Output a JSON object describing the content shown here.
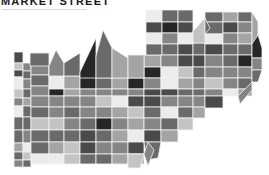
{
  "header": {
    "title": "MARKET STREET"
  },
  "map": {
    "style": "grayscale tiled choropleth",
    "palette": {
      "lightest": "#ececec",
      "light": "#c4c4c4",
      "mid_light": "#a4a4a4",
      "mid": "#858585",
      "mid_dark": "#6a6a6a",
      "dark": "#4a4a4a",
      "darkest": "#262626",
      "stroke": "#f2f2f2"
    },
    "tiles": [
      {
        "x": 14,
        "y": 52,
        "w": 9,
        "h": 11,
        "f": "#4a4a4a"
      },
      {
        "x": 14,
        "y": 63,
        "w": 9,
        "h": 7,
        "f": "#c4c4c4"
      },
      {
        "x": 14,
        "y": 70,
        "w": 9,
        "h": 7,
        "f": "#4a4a4a"
      },
      {
        "x": 14,
        "y": 77,
        "w": 9,
        "h": 12,
        "f": "#ececec"
      },
      {
        "x": 14,
        "y": 89,
        "w": 9,
        "h": 9,
        "f": "#c4c4c4"
      },
      {
        "x": 14,
        "y": 98,
        "w": 9,
        "h": 8,
        "f": "#858585"
      },
      {
        "x": 14,
        "y": 106,
        "w": 9,
        "h": 11,
        "f": "#ececec"
      },
      {
        "x": 14,
        "y": 117,
        "w": 9,
        "h": 13,
        "f": "#6a6a6a"
      },
      {
        "x": 14,
        "y": 130,
        "w": 9,
        "h": 13,
        "f": "#6a6a6a"
      },
      {
        "x": 14,
        "y": 143,
        "w": 9,
        "h": 9,
        "f": "#a4a4a4"
      },
      {
        "x": 14,
        "y": 152,
        "w": 9,
        "h": 8,
        "f": "#6a6a6a"
      },
      {
        "x": 14,
        "y": 160,
        "w": 9,
        "h": 7,
        "f": "#858585"
      },
      {
        "x": 23,
        "y": 63,
        "w": 8,
        "h": 8,
        "f": "#858585"
      },
      {
        "x": 23,
        "y": 71,
        "w": 8,
        "h": 8,
        "f": "#6a6a6a"
      },
      {
        "x": 23,
        "y": 79,
        "w": 8,
        "h": 10,
        "f": "#858585"
      },
      {
        "x": 23,
        "y": 89,
        "w": 8,
        "h": 9,
        "f": "#6a6a6a"
      },
      {
        "x": 23,
        "y": 98,
        "w": 8,
        "h": 8,
        "f": "#a4a4a4"
      },
      {
        "x": 23,
        "y": 106,
        "w": 8,
        "h": 11,
        "f": "#6a6a6a"
      },
      {
        "x": 23,
        "y": 117,
        "w": 8,
        "h": 13,
        "f": "#6a6a6a"
      },
      {
        "x": 23,
        "y": 130,
        "w": 8,
        "h": 13,
        "f": "#858585"
      },
      {
        "x": 23,
        "y": 143,
        "w": 8,
        "h": 9,
        "f": "#ececec"
      },
      {
        "x": 23,
        "y": 152,
        "w": 8,
        "h": 8,
        "f": "#c4c4c4"
      },
      {
        "x": 23,
        "y": 160,
        "w": 8,
        "h": 7,
        "f": "#6a6a6a"
      },
      {
        "x": 31,
        "y": 53,
        "w": 18,
        "h": 11,
        "f": "#6a6a6a"
      },
      {
        "x": 31,
        "y": 64,
        "w": 18,
        "h": 11,
        "f": "#858585"
      },
      {
        "x": 31,
        "y": 75,
        "w": 18,
        "h": 11,
        "f": "#6a6a6a"
      },
      {
        "x": 31,
        "y": 86,
        "w": 18,
        "h": 10,
        "f": "#858585"
      },
      {
        "x": 31,
        "y": 96,
        "w": 18,
        "h": 11,
        "f": "#858585"
      },
      {
        "x": 31,
        "y": 107,
        "w": 18,
        "h": 11,
        "f": "#6a6a6a"
      },
      {
        "x": 31,
        "y": 118,
        "w": 18,
        "h": 12,
        "f": "#c4c4c4"
      },
      {
        "x": 31,
        "y": 130,
        "w": 18,
        "h": 12,
        "f": "#6a6a6a"
      },
      {
        "x": 31,
        "y": 142,
        "w": 18,
        "h": 12,
        "f": "#6a6a6a"
      },
      {
        "x": 31,
        "y": 154,
        "w": 18,
        "h": 10,
        "f": "#ececec"
      },
      {
        "x": 49,
        "y": 66,
        "w": 15,
        "h": 10,
        "f": "#858585"
      },
      {
        "x": 49,
        "y": 76,
        "w": 15,
        "h": 13,
        "f": "#ececec"
      },
      {
        "x": 49,
        "y": 89,
        "w": 15,
        "h": 7,
        "f": "#262626"
      },
      {
        "x": 49,
        "y": 96,
        "w": 15,
        "h": 11,
        "f": "#858585"
      },
      {
        "x": 49,
        "y": 107,
        "w": 15,
        "h": 11,
        "f": "#858585"
      },
      {
        "x": 49,
        "y": 118,
        "w": 15,
        "h": 12,
        "f": "#c4c4c4"
      },
      {
        "x": 49,
        "y": 130,
        "w": 15,
        "h": 12,
        "f": "#6a6a6a"
      },
      {
        "x": 49,
        "y": 142,
        "w": 15,
        "h": 12,
        "f": "#a4a4a4"
      },
      {
        "x": 49,
        "y": 154,
        "w": 15,
        "h": 10,
        "f": "#ececec"
      },
      {
        "x": 64,
        "y": 63,
        "w": 16,
        "h": 13,
        "f": "#6a6a6a"
      },
      {
        "x": 64,
        "y": 76,
        "w": 16,
        "h": 13,
        "f": "#a4a4a4"
      },
      {
        "x": 64,
        "y": 89,
        "w": 16,
        "h": 7,
        "f": "#a4a4a4"
      },
      {
        "x": 64,
        "y": 96,
        "w": 16,
        "h": 11,
        "f": "#858585"
      },
      {
        "x": 64,
        "y": 107,
        "w": 16,
        "h": 11,
        "f": "#6a6a6a"
      },
      {
        "x": 64,
        "y": 118,
        "w": 16,
        "h": 12,
        "f": "#858585"
      },
      {
        "x": 64,
        "y": 130,
        "w": 16,
        "h": 12,
        "f": "#6a6a6a"
      },
      {
        "x": 64,
        "y": 142,
        "w": 16,
        "h": 12,
        "f": "#c4c4c4"
      },
      {
        "x": 64,
        "y": 154,
        "w": 16,
        "h": 10,
        "f": "#c4c4c4"
      },
      {
        "x": 80,
        "y": 72,
        "w": 16,
        "h": 17,
        "f": "#262626"
      },
      {
        "x": 80,
        "y": 89,
        "w": 16,
        "h": 7,
        "f": "#858585"
      },
      {
        "x": 80,
        "y": 96,
        "w": 16,
        "h": 11,
        "f": "#858585"
      },
      {
        "x": 80,
        "y": 107,
        "w": 16,
        "h": 11,
        "f": "#858585"
      },
      {
        "x": 80,
        "y": 118,
        "w": 16,
        "h": 12,
        "f": "#6a6a6a"
      },
      {
        "x": 80,
        "y": 130,
        "w": 16,
        "h": 12,
        "f": "#4a4a4a"
      },
      {
        "x": 80,
        "y": 142,
        "w": 16,
        "h": 12,
        "f": "#4a4a4a"
      },
      {
        "x": 80,
        "y": 154,
        "w": 16,
        "h": 10,
        "f": "#6a6a6a"
      },
      {
        "x": 96,
        "y": 56,
        "w": 16,
        "h": 22,
        "f": "#6a6a6a"
      },
      {
        "x": 96,
        "y": 78,
        "w": 16,
        "h": 11,
        "f": "#6a6a6a"
      },
      {
        "x": 96,
        "y": 89,
        "w": 16,
        "h": 7,
        "f": "#858585"
      },
      {
        "x": 96,
        "y": 96,
        "w": 16,
        "h": 11,
        "f": "#c4c4c4"
      },
      {
        "x": 96,
        "y": 107,
        "w": 16,
        "h": 11,
        "f": "#858585"
      },
      {
        "x": 96,
        "y": 118,
        "w": 16,
        "h": 12,
        "f": "#262626"
      },
      {
        "x": 96,
        "y": 130,
        "w": 16,
        "h": 12,
        "f": "#6a6a6a"
      },
      {
        "x": 96,
        "y": 142,
        "w": 16,
        "h": 12,
        "f": "#858585"
      },
      {
        "x": 96,
        "y": 154,
        "w": 16,
        "h": 10,
        "f": "#6a6a6a"
      },
      {
        "x": 112,
        "y": 58,
        "w": 16,
        "h": 20,
        "f": "#a4a4a4"
      },
      {
        "x": 112,
        "y": 78,
        "w": 16,
        "h": 11,
        "f": "#a4a4a4"
      },
      {
        "x": 112,
        "y": 89,
        "w": 16,
        "h": 7,
        "f": "#858585"
      },
      {
        "x": 112,
        "y": 96,
        "w": 16,
        "h": 11,
        "f": "#ececec"
      },
      {
        "x": 112,
        "y": 107,
        "w": 16,
        "h": 11,
        "f": "#a4a4a4"
      },
      {
        "x": 112,
        "y": 118,
        "w": 16,
        "h": 12,
        "f": "#858585"
      },
      {
        "x": 112,
        "y": 130,
        "w": 16,
        "h": 12,
        "f": "#a4a4a4"
      },
      {
        "x": 112,
        "y": 142,
        "w": 16,
        "h": 12,
        "f": "#858585"
      },
      {
        "x": 112,
        "y": 154,
        "w": 16,
        "h": 10,
        "f": "#a4a4a4"
      },
      {
        "x": 128,
        "y": 55,
        "w": 16,
        "h": 23,
        "f": "#a4a4a4"
      },
      {
        "x": 128,
        "y": 78,
        "w": 16,
        "h": 11,
        "f": "#262626"
      },
      {
        "x": 128,
        "y": 89,
        "w": 16,
        "h": 7,
        "f": "#858585"
      },
      {
        "x": 128,
        "y": 96,
        "w": 16,
        "h": 11,
        "f": "#4a4a4a"
      },
      {
        "x": 128,
        "y": 107,
        "w": 16,
        "h": 11,
        "f": "#c4c4c4"
      },
      {
        "x": 128,
        "y": 118,
        "w": 16,
        "h": 12,
        "f": "#a4a4a4"
      },
      {
        "x": 128,
        "y": 130,
        "w": 16,
        "h": 12,
        "f": "#ececec"
      },
      {
        "x": 128,
        "y": 142,
        "w": 16,
        "h": 12,
        "f": "#4a4a4a"
      },
      {
        "x": 128,
        "y": 154,
        "w": 16,
        "h": 10,
        "f": "#a4a4a4"
      },
      {
        "x": 144,
        "y": 55,
        "w": 17,
        "h": 12,
        "f": "#a4a4a4"
      },
      {
        "x": 144,
        "y": 67,
        "w": 17,
        "h": 11,
        "f": "#262626"
      },
      {
        "x": 144,
        "y": 78,
        "w": 17,
        "h": 11,
        "f": "#858585"
      },
      {
        "x": 144,
        "y": 89,
        "w": 17,
        "h": 7,
        "f": "#4a4a4a"
      },
      {
        "x": 144,
        "y": 96,
        "w": 17,
        "h": 11,
        "f": "#4a4a4a"
      },
      {
        "x": 144,
        "y": 107,
        "w": 17,
        "h": 11,
        "f": "#6a6a6a"
      },
      {
        "x": 144,
        "y": 118,
        "w": 17,
        "h": 12,
        "f": "#858585"
      },
      {
        "x": 144,
        "y": 130,
        "w": 17,
        "h": 12,
        "f": "#4a4a4a"
      },
      {
        "x": 146,
        "y": 10,
        "w": 16,
        "h": 12,
        "f": "#ececec"
      },
      {
        "x": 146,
        "y": 22,
        "w": 16,
        "h": 11,
        "f": "#4a4a4a"
      },
      {
        "x": 146,
        "y": 33,
        "w": 16,
        "h": 11,
        "f": "#ececec"
      },
      {
        "x": 146,
        "y": 44,
        "w": 16,
        "h": 11,
        "f": "#6a6a6a"
      },
      {
        "x": 162,
        "y": 10,
        "w": 16,
        "h": 12,
        "f": "#6a6a6a"
      },
      {
        "x": 162,
        "y": 22,
        "w": 16,
        "h": 11,
        "f": "#262626"
      },
      {
        "x": 162,
        "y": 33,
        "w": 16,
        "h": 11,
        "f": "#858585"
      },
      {
        "x": 162,
        "y": 44,
        "w": 16,
        "h": 11,
        "f": "#6a6a6a"
      },
      {
        "x": 161,
        "y": 55,
        "w": 17,
        "h": 12,
        "f": "#858585"
      },
      {
        "x": 161,
        "y": 67,
        "w": 17,
        "h": 11,
        "f": "#ececec"
      },
      {
        "x": 161,
        "y": 78,
        "w": 17,
        "h": 11,
        "f": "#ececec"
      },
      {
        "x": 161,
        "y": 89,
        "w": 17,
        "h": 7,
        "f": "#4a4a4a"
      },
      {
        "x": 161,
        "y": 96,
        "w": 17,
        "h": 11,
        "f": "#858585"
      },
      {
        "x": 161,
        "y": 107,
        "w": 17,
        "h": 11,
        "f": "#ececec"
      },
      {
        "x": 161,
        "y": 118,
        "w": 17,
        "h": 12,
        "f": "#6a6a6a"
      },
      {
        "x": 161,
        "y": 130,
        "w": 17,
        "h": 12,
        "f": "#a4a4a4"
      },
      {
        "x": 178,
        "y": 10,
        "w": 15,
        "h": 12,
        "f": "#6a6a6a"
      },
      {
        "x": 178,
        "y": 22,
        "w": 15,
        "h": 11,
        "f": "#4a4a4a"
      },
      {
        "x": 178,
        "y": 33,
        "w": 15,
        "h": 11,
        "f": "#ececec"
      },
      {
        "x": 178,
        "y": 44,
        "w": 15,
        "h": 11,
        "f": "#4a4a4a"
      },
      {
        "x": 178,
        "y": 55,
        "w": 15,
        "h": 12,
        "f": "#4a4a4a"
      },
      {
        "x": 178,
        "y": 67,
        "w": 15,
        "h": 11,
        "f": "#c4c4c4"
      },
      {
        "x": 178,
        "y": 78,
        "w": 15,
        "h": 11,
        "f": "#a4a4a4"
      },
      {
        "x": 178,
        "y": 89,
        "w": 15,
        "h": 7,
        "f": "#6a6a6a"
      },
      {
        "x": 178,
        "y": 96,
        "w": 15,
        "h": 11,
        "f": "#858585"
      },
      {
        "x": 178,
        "y": 107,
        "w": 15,
        "h": 11,
        "f": "#6a6a6a"
      },
      {
        "x": 178,
        "y": 118,
        "w": 15,
        "h": 12,
        "f": "#c4c4c4"
      },
      {
        "x": 193,
        "y": 31,
        "w": 12,
        "h": 12,
        "f": "#858585"
      },
      {
        "x": 193,
        "y": 43,
        "w": 12,
        "h": 12,
        "f": "#6a6a6a"
      },
      {
        "x": 193,
        "y": 55,
        "w": 12,
        "h": 12,
        "f": "#4a4a4a"
      },
      {
        "x": 193,
        "y": 67,
        "w": 12,
        "h": 11,
        "f": "#6a6a6a"
      },
      {
        "x": 193,
        "y": 78,
        "w": 12,
        "h": 11,
        "f": "#858585"
      },
      {
        "x": 193,
        "y": 89,
        "w": 12,
        "h": 7,
        "f": "#6a6a6a"
      },
      {
        "x": 193,
        "y": 96,
        "w": 12,
        "h": 11,
        "f": "#858585"
      },
      {
        "x": 193,
        "y": 107,
        "w": 12,
        "h": 11,
        "f": "#a4a4a4"
      },
      {
        "x": 205,
        "y": 12,
        "w": 18,
        "h": 10,
        "f": "#6a6a6a"
      },
      {
        "x": 205,
        "y": 22,
        "w": 18,
        "h": 12,
        "f": "#6a6a6a"
      },
      {
        "x": 205,
        "y": 34,
        "w": 18,
        "h": 10,
        "f": "#ececec"
      },
      {
        "x": 205,
        "y": 44,
        "w": 18,
        "h": 11,
        "f": "#4a4a4a"
      },
      {
        "x": 205,
        "y": 55,
        "w": 18,
        "h": 12,
        "f": "#858585"
      },
      {
        "x": 205,
        "y": 67,
        "w": 18,
        "h": 11,
        "f": "#858585"
      },
      {
        "x": 205,
        "y": 78,
        "w": 18,
        "h": 11,
        "f": "#c4c4c4"
      },
      {
        "x": 205,
        "y": 89,
        "w": 18,
        "h": 7,
        "f": "#858585"
      },
      {
        "x": 205,
        "y": 96,
        "w": 18,
        "h": 12,
        "f": "#4a4a4a"
      },
      {
        "x": 223,
        "y": 12,
        "w": 15,
        "h": 10,
        "f": "#a4a4a4"
      },
      {
        "x": 223,
        "y": 22,
        "w": 15,
        "h": 11,
        "f": "#4a4a4a"
      },
      {
        "x": 223,
        "y": 33,
        "w": 15,
        "h": 11,
        "f": "#858585"
      },
      {
        "x": 223,
        "y": 44,
        "w": 15,
        "h": 11,
        "f": "#6a6a6a"
      },
      {
        "x": 223,
        "y": 55,
        "w": 15,
        "h": 12,
        "f": "#6a6a6a"
      },
      {
        "x": 223,
        "y": 67,
        "w": 15,
        "h": 11,
        "f": "#858585"
      },
      {
        "x": 223,
        "y": 78,
        "w": 15,
        "h": 11,
        "f": "#858585"
      },
      {
        "x": 223,
        "y": 89,
        "w": 15,
        "h": 7,
        "f": "#ececec"
      },
      {
        "x": 238,
        "y": 12,
        "w": 14,
        "h": 10,
        "f": "#6a6a6a"
      },
      {
        "x": 238,
        "y": 22,
        "w": 14,
        "h": 11,
        "f": "#858585"
      },
      {
        "x": 238,
        "y": 33,
        "w": 14,
        "h": 11,
        "f": "#a4a4a4"
      },
      {
        "x": 238,
        "y": 44,
        "w": 14,
        "h": 11,
        "f": "#6a6a6a"
      },
      {
        "x": 238,
        "y": 55,
        "w": 14,
        "h": 12,
        "f": "#262626"
      },
      {
        "x": 238,
        "y": 67,
        "w": 14,
        "h": 11,
        "f": "#858585"
      },
      {
        "x": 238,
        "y": 78,
        "w": 14,
        "h": 11,
        "f": "#6a6a6a"
      },
      {
        "x": 238,
        "y": 89,
        "w": 14,
        "h": 7,
        "f": "#a4a4a4"
      }
    ],
    "shapes": [
      {
        "pts": "30,53 49,53 49,66 30,66",
        "f": "#6a6a6a"
      },
      {
        "pts": "49,66 56,50 64,63 64,76 49,76",
        "f": "#858585"
      },
      {
        "pts": "64,63 80,53 80,76 64,76",
        "f": "#6a6a6a"
      },
      {
        "pts": "80,72 96,38 96,56 96,78 80,78",
        "f": "#262626"
      },
      {
        "pts": "96,56 103,30 112,48 112,78 96,78",
        "f": "#6a6a6a"
      },
      {
        "pts": "112,48 128,58 128,78 112,78",
        "f": "#a4a4a4"
      },
      {
        "pts": "128,55 144,55 144,78 128,78",
        "f": "#a4a4a4"
      },
      {
        "pts": "193,31 205,18 205,43 193,43",
        "f": "#c4c4c4"
      },
      {
        "pts": "205,18 210,28 205,34",
        "f": "#6a6a6a"
      },
      {
        "pts": "252,12 258,22 258,44 252,44",
        "f": "#a4a4a4"
      },
      {
        "pts": "252,44 258,35 262,48 262,58 252,58",
        "f": "#262626"
      },
      {
        "pts": "252,58 262,58 262,70 252,70",
        "f": "#858585"
      },
      {
        "pts": "252,70 262,70 258,82 252,82",
        "f": "#6a6a6a"
      },
      {
        "pts": "238,96 252,82 252,90 240,104",
        "f": "#858585"
      },
      {
        "pts": "144,142 161,142 158,158 147,160",
        "f": "#6a6a6a"
      },
      {
        "pts": "128,154 144,154 140,168 128,168",
        "f": "#c4c4c4"
      },
      {
        "pts": "144,154 148,142 154,150 148,166",
        "f": "#858585"
      }
    ]
  }
}
